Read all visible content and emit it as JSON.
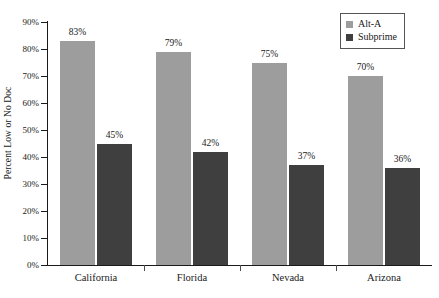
{
  "chart_data": {
    "type": "bar",
    "title": "",
    "subtitle": "",
    "xlabel": "",
    "ylabel": "Percent Low or No Doc",
    "categories": [
      "California",
      "Florida",
      "Nevada",
      "Arizona"
    ],
    "series": [
      {
        "name": "Alt-A",
        "color": "#9d9d9d",
        "values": [
          83,
          79,
          75,
          70
        ],
        "labels": [
          "83%",
          "79%",
          "75%",
          "70%"
        ]
      },
      {
        "name": "Subprime",
        "color": "#3f3f3f",
        "values": [
          45,
          42,
          37,
          36
        ],
        "labels": [
          "45%",
          "42%",
          "37%",
          "36%"
        ]
      }
    ],
    "ylim": [
      0,
      90
    ],
    "ytick_values": [
      0,
      10,
      20,
      30,
      40,
      50,
      60,
      70,
      80,
      90
    ],
    "ytick_labels": [
      "0%",
      "10%",
      "20%",
      "30%",
      "40%",
      "50%",
      "60%",
      "70%",
      "80%",
      "90%"
    ],
    "grid": false,
    "legend_position": "top-right",
    "legend_entries": [
      "Alt-A",
      "Subprime"
    ]
  },
  "axes": {
    "y_title": "Percent Low or No Doc",
    "ticks": [
      {
        "label": "90%",
        "value": 90
      },
      {
        "label": "80%",
        "value": 80
      },
      {
        "label": "70%",
        "value": 70
      },
      {
        "label": "60%",
        "value": 60
      },
      {
        "label": "50%",
        "value": 50
      },
      {
        "label": "40%",
        "value": 40
      },
      {
        "label": "30%",
        "value": 30
      },
      {
        "label": "20%",
        "value": 20
      },
      {
        "label": "10%",
        "value": 10
      },
      {
        "label": "0%",
        "value": 0
      }
    ]
  },
  "legend": {
    "items": [
      {
        "label": "Alt-A",
        "color": "#9d9d9d"
      },
      {
        "label": "Subprime",
        "color": "#3f3f3f"
      }
    ]
  },
  "groups": [
    {
      "category": "California",
      "bars": [
        {
          "series": "Alt-A",
          "value": 83,
          "label": "83%"
        },
        {
          "series": "Subprime",
          "value": 45,
          "label": "45%"
        }
      ]
    },
    {
      "category": "Florida",
      "bars": [
        {
          "series": "Alt-A",
          "value": 79,
          "label": "79%"
        },
        {
          "series": "Subprime",
          "value": 42,
          "label": "42%"
        }
      ]
    },
    {
      "category": "Nevada",
      "bars": [
        {
          "series": "Alt-A",
          "value": 75,
          "label": "75%"
        },
        {
          "series": "Subprime",
          "value": 37,
          "label": "37%"
        }
      ]
    },
    {
      "category": "Arizona",
      "bars": [
        {
          "series": "Alt-A",
          "value": 70,
          "label": "70%"
        },
        {
          "series": "Subprime",
          "value": 36,
          "label": "36%"
        }
      ]
    }
  ]
}
